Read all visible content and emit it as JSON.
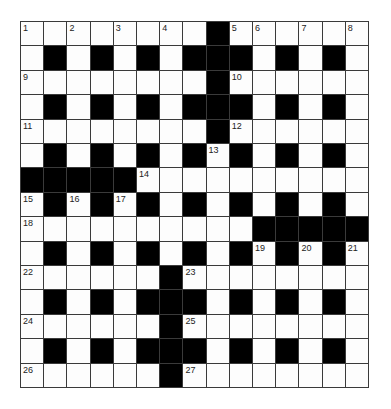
{
  "puzzle": {
    "rows": 15,
    "cols": 15,
    "colors": {
      "block": "#000000",
      "cell": "#fdfdfd",
      "gridline": "#3a3a3a",
      "number": "#222222"
    },
    "grid": [
      "WWWWWWWW#WWWWWW",
      "W#W#W#W###W#W#W",
      "WWWWWWWW#WWWWWW",
      "W#W#W#W###W#W#W",
      "WWWWWWWW#WWWWWW",
      "W#W#W#W#W#W#W#W",
      "#####WWWWWWWWWW",
      "W#W#W#W#W#W#W#W",
      "WWWWWWWWWW#####",
      "W#W#W#W#W#W#W#W",
      "WWWWWW#WWWWWWWW",
      "W#W#W###W#W#W#W",
      "WWWWWW#WWWWWWWW",
      "W#W#W###W#W#W#W",
      "WWWWWW#WWWWWWWW"
    ],
    "numbers": [
      {
        "row": 0,
        "col": 0,
        "n": "1"
      },
      {
        "row": 0,
        "col": 2,
        "n": "2"
      },
      {
        "row": 0,
        "col": 4,
        "n": "3"
      },
      {
        "row": 0,
        "col": 6,
        "n": "4"
      },
      {
        "row": 0,
        "col": 9,
        "n": "5"
      },
      {
        "row": 0,
        "col": 10,
        "n": "6"
      },
      {
        "row": 0,
        "col": 12,
        "n": "7"
      },
      {
        "row": 0,
        "col": 14,
        "n": "8"
      },
      {
        "row": 2,
        "col": 0,
        "n": "9"
      },
      {
        "row": 2,
        "col": 9,
        "n": "10"
      },
      {
        "row": 4,
        "col": 0,
        "n": "11"
      },
      {
        "row": 4,
        "col": 9,
        "n": "12"
      },
      {
        "row": 5,
        "col": 8,
        "n": "13"
      },
      {
        "row": 6,
        "col": 5,
        "n": "14"
      },
      {
        "row": 7,
        "col": 0,
        "n": "15"
      },
      {
        "row": 7,
        "col": 2,
        "n": "16"
      },
      {
        "row": 7,
        "col": 4,
        "n": "17"
      },
      {
        "row": 8,
        "col": 0,
        "n": "18"
      },
      {
        "row": 9,
        "col": 10,
        "n": "19"
      },
      {
        "row": 9,
        "col": 12,
        "n": "20"
      },
      {
        "row": 9,
        "col": 14,
        "n": "21"
      },
      {
        "row": 10,
        "col": 0,
        "n": "22"
      },
      {
        "row": 10,
        "col": 7,
        "n": "23"
      },
      {
        "row": 12,
        "col": 0,
        "n": "24"
      },
      {
        "row": 12,
        "col": 7,
        "n": "25"
      },
      {
        "row": 14,
        "col": 0,
        "n": "26"
      },
      {
        "row": 14,
        "col": 7,
        "n": "27"
      }
    ],
    "entries": {}
  }
}
